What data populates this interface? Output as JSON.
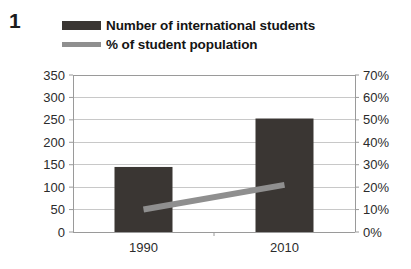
{
  "figure": {
    "number": "1"
  },
  "legend": {
    "entries": [
      {
        "label": "Number of international students",
        "marker": "bar-swatch-icon",
        "color": "#3a3633"
      },
      {
        "label": "% of student population",
        "marker": "line-swatch-icon",
        "color": "#8f8f8f"
      }
    ]
  },
  "chart_data": {
    "type": "bar",
    "title": "",
    "subtitle": "",
    "xlabel": "",
    "ylabel": "",
    "categories": [
      "1990",
      "2010"
    ],
    "grid": true,
    "legend_position": "top",
    "series": [
      {
        "name": "Number of international students",
        "type": "bar",
        "axis": "left",
        "color": "#3a3633",
        "values": [
          145,
          253
        ]
      },
      {
        "name": "% of student population",
        "type": "line",
        "axis": "right",
        "color": "#8f8f8f",
        "values": [
          10,
          21
        ]
      }
    ],
    "axes": {
      "left": {
        "ylim": [
          0,
          350
        ],
        "step": 50,
        "ticks": [
          "0",
          "50",
          "100",
          "150",
          "200",
          "250",
          "300",
          "350"
        ]
      },
      "right": {
        "ylim": [
          0,
          70
        ],
        "step": 10,
        "suffix": "%",
        "ticks": [
          "0%",
          "10%",
          "20%",
          "30%",
          "40%",
          "50%",
          "60%",
          "70%"
        ]
      }
    },
    "colors": {
      "bar": "#3a3633",
      "line": "#8f8f8f",
      "grid": "#c8c8c8",
      "axis": "#9a9a9a",
      "background": "#ffffff"
    }
  }
}
